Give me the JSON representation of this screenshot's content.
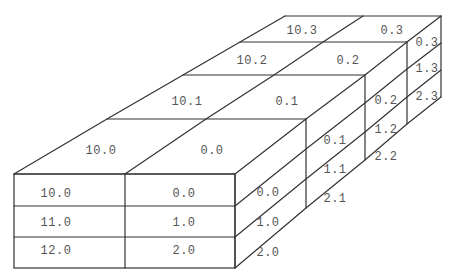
{
  "diagram": {
    "title": "",
    "colors": {
      "stroke": "#333333",
      "text": "#555555",
      "background": "#ffffff"
    },
    "front_face": [
      {
        "left": "10.0",
        "right": "0.0"
      },
      {
        "left": "11.0",
        "right": "1.0"
      },
      {
        "left": "12.0",
        "right": "2.0"
      }
    ],
    "top_face": [
      {
        "left": "10.0",
        "right": "0.0"
      },
      {
        "left": "10.1",
        "right": "0.1"
      },
      {
        "left": "10.2",
        "right": "0.2"
      },
      {
        "left": "10.3",
        "right": "0.3"
      }
    ],
    "right_face": [
      [
        "0.0",
        "1.0",
        "2.0"
      ],
      [
        "0.1",
        "1.1",
        "2.1"
      ],
      [
        "0.2",
        "1.2",
        "2.2"
      ],
      [
        "0.3",
        "1.3",
        "2.3"
      ]
    ]
  }
}
